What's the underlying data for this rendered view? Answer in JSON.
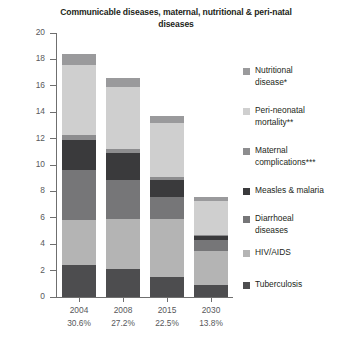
{
  "chart_data": {
    "type": "bar",
    "stacked": true,
    "title": "Communicable diseases, maternal, nutritional & peri-natal diseases",
    "xlabel": "",
    "ylabel": "Percent",
    "ylim": [
      0,
      20
    ],
    "ytick_step": 2,
    "yticks": [
      "0",
      "2",
      "4",
      "6",
      "8",
      "10",
      "12",
      "14",
      "16",
      "18",
      "20"
    ],
    "grid": false,
    "legend_position": "right",
    "categories": [
      "2004",
      "2008",
      "2015",
      "2030"
    ],
    "category_sublabels": [
      "30.6%",
      "27.2%",
      "22.5%",
      "13.8%"
    ],
    "totals": [
      18.4,
      16.6,
      13.7,
      7.6
    ],
    "series": [
      {
        "name": "Tuberculosis",
        "color": "#4d4d4f",
        "values": [
          2.4,
          2.1,
          1.5,
          0.9
        ]
      },
      {
        "name": "HIV/AIDS",
        "color": "#b4b4b4",
        "values": [
          3.4,
          3.8,
          4.4,
          2.6
        ]
      },
      {
        "name": "Diarrhoeal diseases",
        "color": "#767678",
        "values": [
          3.8,
          3.0,
          1.7,
          0.8
        ]
      },
      {
        "name": "Measles & malaria",
        "color": "#3a3a3c",
        "values": [
          2.3,
          2.0,
          1.3,
          0.3
        ]
      },
      {
        "name": "Maternal complications***",
        "color": "#8d8d8f",
        "values": [
          0.4,
          0.3,
          0.2,
          0.1
        ]
      },
      {
        "name": "Peri-neonatal mortality**",
        "color": "#cfcfcf",
        "values": [
          5.3,
          4.7,
          4.1,
          2.6
        ]
      },
      {
        "name": "Nutritional disease*",
        "color": "#9a9a9c",
        "values": [
          0.8,
          0.7,
          0.5,
          0.3
        ]
      }
    ]
  },
  "legend": {
    "items": [
      {
        "label_line1": "Nutritional",
        "label_line2": "disease*",
        "color": "#9a9a9c"
      },
      {
        "label_line1": "Peri-neonatal",
        "label_line2": "mortality**",
        "color": "#cfcfcf"
      },
      {
        "label_line1": "Maternal",
        "label_line2": "complications***",
        "color": "#8d8d8f"
      },
      {
        "label_line1": "Measles & malaria",
        "label_line2": "",
        "color": "#3a3a3c"
      },
      {
        "label_line1": "Diarrhoeal",
        "label_line2": "diseases",
        "color": "#767678"
      },
      {
        "label_line1": "HIV/AIDS",
        "label_line2": "",
        "color": "#b4b4b4"
      },
      {
        "label_line1": "Tuberculosis",
        "label_line2": "",
        "color": "#4d4d4f"
      }
    ]
  }
}
